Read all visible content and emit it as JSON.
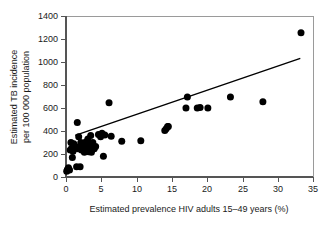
{
  "chart_data": {
    "type": "scatter",
    "title": "",
    "subtitle": "",
    "xlabel": "Estimated prevalence HIV adults 15–49 years (%)",
    "ylabel": "Estimated TB incidence\nper 100 000 population",
    "ylabel_line1": "Estimated TB incidence",
    "ylabel_line2": "per 100 000 population",
    "xlim": [
      0,
      35
    ],
    "ylim": [
      0,
      1400
    ],
    "xticks": [
      0,
      5,
      10,
      15,
      20,
      25,
      30,
      35
    ],
    "yticks": [
      0,
      200,
      400,
      600,
      800,
      1000,
      1200,
      1400
    ],
    "xtick_labels": [
      "0",
      "5",
      "10",
      "15",
      "20",
      "25",
      "30",
      "35"
    ],
    "ytick_labels": [
      "0",
      "200",
      "400",
      "600",
      "800",
      "1000",
      "1200",
      "1400"
    ],
    "grid": false,
    "legend": null,
    "marker": "filled-circle",
    "marker_color": "#000000",
    "marker_size_px": 4.6,
    "series": [
      {
        "name": "Countries",
        "points": [
          [
            0.1,
            50
          ],
          [
            0.2,
            65
          ],
          [
            0.35,
            80
          ],
          [
            0.5,
            60
          ],
          [
            0.6,
            235
          ],
          [
            0.7,
            300
          ],
          [
            0.8,
            250
          ],
          [
            0.9,
            170
          ],
          [
            1.0,
            225
          ],
          [
            1.1,
            290
          ],
          [
            1.3,
            255
          ],
          [
            1.5,
            90
          ],
          [
            1.6,
            475
          ],
          [
            1.7,
            245
          ],
          [
            1.8,
            350
          ],
          [
            1.9,
            265
          ],
          [
            2.0,
            90
          ],
          [
            2.1,
            300
          ],
          [
            2.2,
            235
          ],
          [
            2.4,
            275
          ],
          [
            2.5,
            250
          ],
          [
            2.6,
            215
          ],
          [
            2.8,
            305
          ],
          [
            2.9,
            260
          ],
          [
            3.0,
            240
          ],
          [
            3.1,
            330
          ],
          [
            3.2,
            220
          ],
          [
            3.3,
            285
          ],
          [
            3.4,
            255
          ],
          [
            3.5,
            360
          ],
          [
            3.6,
            215
          ],
          [
            3.8,
            300
          ],
          [
            4.0,
            245
          ],
          [
            4.2,
            265
          ],
          [
            4.6,
            370
          ],
          [
            4.9,
            350
          ],
          [
            5.1,
            380
          ],
          [
            5.3,
            180
          ],
          [
            5.5,
            365
          ],
          [
            6.1,
            645
          ],
          [
            6.4,
            355
          ],
          [
            7.9,
            310
          ],
          [
            10.6,
            315
          ],
          [
            14.0,
            405
          ],
          [
            14.2,
            420
          ],
          [
            14.4,
            440
          ],
          [
            14.5,
            440
          ],
          [
            17.0,
            600
          ],
          [
            17.2,
            695
          ],
          [
            18.6,
            600
          ],
          [
            19.0,
            605
          ],
          [
            20.1,
            600
          ],
          [
            23.3,
            695
          ],
          [
            27.9,
            655
          ],
          [
            33.3,
            1255
          ]
        ]
      }
    ],
    "trendline": {
      "type": "linear-fit",
      "x_start": 1.3,
      "y_start": 362,
      "x_end": 33.2,
      "y_end": 1032,
      "color": "#000000"
    }
  }
}
